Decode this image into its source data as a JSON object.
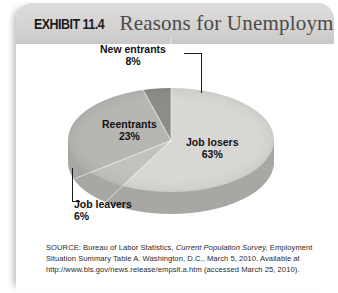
{
  "header": {
    "exhibit_number": "EXHIBIT 11.4",
    "title": "Reasons for Unemployment"
  },
  "chart_data": {
    "type": "pie",
    "title": "Reasons for Unemployment",
    "categories": [
      "Job losers",
      "Job leavers",
      "Reentrants",
      "New entrants"
    ],
    "values": [
      63,
      6,
      23,
      8
    ],
    "value_labels": [
      "63%",
      "6%",
      "23%",
      "8%"
    ],
    "unit": "percent",
    "colors": [
      "#d9d7d4",
      "#c3c1be",
      "#b8b6b3",
      "#8e8c89"
    ],
    "legend": "none",
    "labels_inline": true,
    "three_d": true,
    "slices": [
      {
        "name": "Job losers",
        "label": "Job losers",
        "percent_label": "63%",
        "value": 63,
        "color": "#d9d7d4",
        "placement": "inside"
      },
      {
        "name": "Reentrants",
        "label": "Reentrants",
        "percent_label": "23%",
        "value": 23,
        "color": "#b8b6b3",
        "placement": "inside"
      },
      {
        "name": "New entrants",
        "label": "New entrants",
        "percent_label": "8%",
        "value": 8,
        "color": "#8e8c89",
        "placement": "callout-top"
      },
      {
        "name": "Job leavers",
        "label": "Job leavers",
        "percent_label": "6%",
        "value": 6,
        "color": "#c3c1be",
        "placement": "callout-bottom"
      }
    ]
  },
  "source": {
    "prefix": "SOURCE: Bureau of Labor Statistics, ",
    "italic_title": "Current Population Survey,",
    "rest": " Employment Situation Summary Table A. Washington, D.C., March 5, 2010. Available at http://www.bls.gov/news.release/empsit.a.htm (accessed March 25, 2010)."
  }
}
